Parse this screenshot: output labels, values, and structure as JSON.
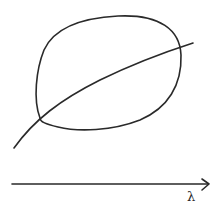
{
  "diagram": {
    "type": "sketch",
    "elements": [
      {
        "kind": "closed-loop",
        "description": "tilted oval"
      },
      {
        "kind": "curve",
        "description": "rising concave curve crossing the oval twice"
      },
      {
        "kind": "axis-arrow",
        "direction": "right"
      }
    ],
    "axis_label": "λ",
    "stroke_color": "#2a2a2a",
    "background_color": "#ffffff"
  }
}
